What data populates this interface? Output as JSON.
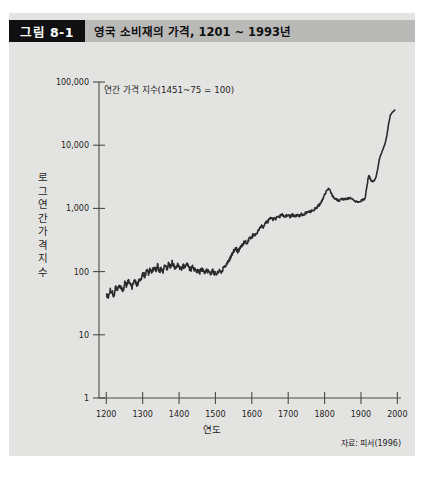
{
  "figure": {
    "number_label": "그림 8-1",
    "title": "영국 소비재의 가격, 1201 ~ 1993년",
    "source": "자료: 피서(1996)",
    "annotation": "연간 가격 지수(1451~75 = 100)",
    "background_color": "#e3e3e1",
    "header_color": "#b9b9b7",
    "number_box_color": "#101010",
    "line_color": "#2b2b2b"
  },
  "ylabel_chars": [
    "로",
    "그",
    "연",
    "간",
    "가",
    "격",
    "지",
    "수"
  ],
  "chart_data": {
    "type": "line",
    "title": "영국 소비재의 가격, 1201 ~ 1993년",
    "subtitle": "연간 가격 지수(1451~75 = 100)",
    "xlabel": "연도",
    "ylabel": "로그 연간 가격 지수",
    "yscale": "log",
    "ylim": [
      1,
      100000
    ],
    "xlim": [
      1180,
      2010
    ],
    "grid": false,
    "legend": "none",
    "yticks": [
      1,
      10,
      100,
      1000,
      10000,
      100000
    ],
    "ytick_labels": [
      "1",
      "10",
      "100",
      "1,000",
      "10,000",
      "100,000"
    ],
    "xticks": [
      1200,
      1300,
      1400,
      1500,
      1600,
      1700,
      1800,
      1900,
      2000
    ],
    "xtick_labels": [
      "1200",
      "1300",
      "1400",
      "1500",
      "1600",
      "1700",
      "1800",
      "1900",
      "2000"
    ],
    "series": [
      {
        "name": "영국 소비재 가격 지수",
        "x": [
          1201,
          1206,
          1211,
          1216,
          1221,
          1226,
          1231,
          1236,
          1241,
          1246,
          1251,
          1256,
          1261,
          1266,
          1271,
          1276,
          1281,
          1286,
          1291,
          1296,
          1301,
          1306,
          1311,
          1316,
          1321,
          1326,
          1331,
          1336,
          1341,
          1346,
          1351,
          1356,
          1361,
          1366,
          1371,
          1376,
          1381,
          1386,
          1391,
          1396,
          1401,
          1406,
          1411,
          1416,
          1421,
          1426,
          1431,
          1436,
          1441,
          1446,
          1451,
          1456,
          1461,
          1466,
          1471,
          1476,
          1481,
          1486,
          1491,
          1496,
          1501,
          1506,
          1511,
          1516,
          1521,
          1526,
          1531,
          1536,
          1541,
          1546,
          1551,
          1556,
          1561,
          1566,
          1571,
          1576,
          1581,
          1586,
          1591,
          1596,
          1601,
          1606,
          1611,
          1616,
          1621,
          1626,
          1631,
          1636,
          1641,
          1646,
          1651,
          1656,
          1661,
          1666,
          1671,
          1676,
          1681,
          1686,
          1691,
          1696,
          1701,
          1706,
          1711,
          1716,
          1721,
          1726,
          1731,
          1736,
          1741,
          1746,
          1751,
          1756,
          1761,
          1766,
          1771,
          1776,
          1781,
          1786,
          1791,
          1796,
          1801,
          1806,
          1811,
          1816,
          1821,
          1826,
          1831,
          1836,
          1841,
          1846,
          1851,
          1856,
          1861,
          1866,
          1871,
          1876,
          1881,
          1886,
          1891,
          1896,
          1901,
          1906,
          1911,
          1916,
          1921,
          1926,
          1931,
          1936,
          1941,
          1946,
          1951,
          1956,
          1961,
          1966,
          1971,
          1976,
          1981,
          1986,
          1991,
          1993
        ],
        "y": [
          44,
          38,
          52,
          47,
          41,
          58,
          50,
          62,
          55,
          48,
          66,
          59,
          72,
          63,
          57,
          75,
          68,
          61,
          80,
          73,
          95,
          84,
          105,
          92,
          110,
          98,
          120,
          104,
          128,
          96,
          115,
          102,
          125,
          108,
          132,
          118,
          140,
          122,
          112,
          130,
          118,
          108,
          126,
          114,
          132,
          120,
          105,
          118,
          110,
          100,
          104,
          96,
          110,
          102,
          95,
          108,
          100,
          92,
          104,
          97,
          90,
          98,
          105,
          96,
          112,
          120,
          132,
          148,
          165,
          190,
          215,
          240,
          205,
          230,
          255,
          275,
          300,
          285,
          320,
          340,
          360,
          400,
          385,
          430,
          470,
          520,
          495,
          560,
          600,
          640,
          700,
          660,
          720,
          690,
          760,
          730,
          800,
          770,
          740,
          780,
          760,
          740,
          790,
          770,
          750,
          790,
          770,
          810,
          790,
          830,
          860,
          900,
          880,
          920,
          960,
          1000,
          1080,
          1150,
          1250,
          1450,
          1700,
          1900,
          2100,
          1850,
          1600,
          1480,
          1400,
          1350,
          1320,
          1420,
          1380,
          1400,
          1420,
          1450,
          1480,
          1400,
          1350,
          1300,
          1280,
          1300,
          1320,
          1380,
          1450,
          2100,
          3400,
          2900,
          2600,
          2700,
          3100,
          4200,
          6200,
          7400,
          8800,
          10500,
          14000,
          22000,
          30000,
          33000,
          35000,
          36000
        ]
      }
    ]
  }
}
